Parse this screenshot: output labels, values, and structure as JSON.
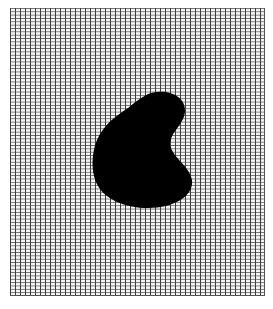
{
  "figure": {
    "grid": {
      "line_color_vertical": "#3c3c3c",
      "line_color_horizontal": "#6a6a6a",
      "background": "#f4f4f4",
      "vertical_spacing_px": 5,
      "horizontal_spacing_px": 3.35
    },
    "blob": {
      "fill": "#000000",
      "shape": "kidney"
    }
  }
}
